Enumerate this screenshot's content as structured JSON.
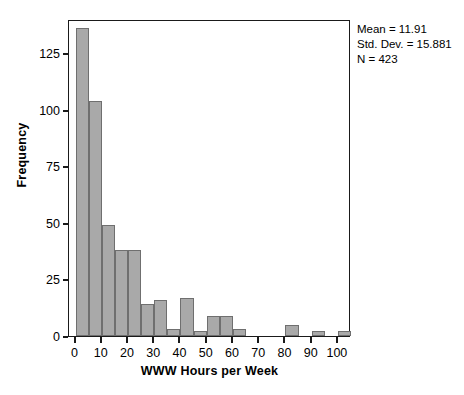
{
  "stats": {
    "mean": "Mean = 11.91",
    "std_dev": "Std. Dev. = 15.881",
    "n": "N = 423"
  },
  "axes": {
    "x_title": "WWW Hours per Week",
    "y_title": "Frequency",
    "x_ticks": [
      "0",
      "10",
      "20",
      "30",
      "40",
      "50",
      "60",
      "70",
      "80",
      "90",
      "100"
    ],
    "y_ticks": [
      "0",
      "25",
      "50",
      "75",
      "100",
      "125"
    ]
  },
  "colors": {
    "bar_fill": "#a9a9a9",
    "bar_border": "#6f6f6f",
    "frame": "#1a1a1a",
    "background": "#ffffff"
  },
  "chart_data": {
    "type": "bar",
    "title": "",
    "xlabel": "WWW Hours per Week",
    "ylabel": "Frequency",
    "xlim": [
      -2.5,
      105
    ],
    "ylim": [
      0,
      140
    ],
    "bin_width": 5,
    "grid": false,
    "legend": null,
    "annotations": [
      "Mean = 11.91",
      "Std. Dev. = 15.881",
      "N = 423"
    ],
    "bin_starts": [
      0,
      5,
      10,
      15,
      20,
      25,
      30,
      35,
      40,
      45,
      50,
      55,
      60,
      65,
      70,
      75,
      80,
      85,
      90,
      95,
      100
    ],
    "categories": [
      "0-5",
      "5-10",
      "10-15",
      "15-20",
      "20-25",
      "25-30",
      "30-35",
      "35-40",
      "40-45",
      "45-50",
      "50-55",
      "55-60",
      "60-65",
      "65-70",
      "70-75",
      "75-80",
      "80-85",
      "85-90",
      "90-95",
      "95-100",
      "100-105"
    ],
    "values": [
      136,
      104,
      49,
      38,
      38,
      14,
      16,
      3,
      17,
      2,
      9,
      9,
      3,
      0,
      0,
      0,
      5,
      0,
      2,
      0,
      2
    ]
  }
}
